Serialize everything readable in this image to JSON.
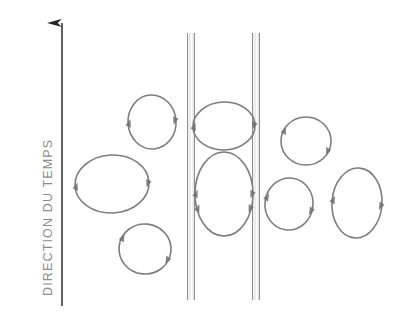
{
  "figure": {
    "width": 407,
    "height": 319,
    "background": "#ffffff",
    "kind": "schematic-diagram"
  },
  "axis": {
    "label": "DIRECTION DU TEMPS",
    "orientation": "vertical-upward",
    "color": "#8c8c8c",
    "line_color": "#2b2b2b",
    "x": 62,
    "y_top": 22,
    "y_bottom": 306,
    "arrowhead": "up"
  },
  "rails": {
    "color": "#8a8a8a",
    "y_top": 33,
    "y_bottom": 300,
    "items": [
      {
        "name": "rail-left",
        "x": 191,
        "band_width": 7
      },
      {
        "name": "rail-right",
        "x": 256,
        "band_width": 7
      }
    ]
  },
  "loops": {
    "stroke_color": "#7d7d7d",
    "node_color": "#6f6f6f",
    "items": [
      {
        "name": "loop-upper-left-small",
        "cx": 152,
        "cy": 122,
        "rx": 24,
        "ry": 27,
        "rotate": -4,
        "nodes": [
          180,
          0
        ]
      },
      {
        "name": "loop-mid-left-large",
        "cx": 112,
        "cy": 184,
        "rx": 37,
        "ry": 29,
        "rotate": -3,
        "nodes": [
          178,
          2
        ]
      },
      {
        "name": "loop-lower-left-small",
        "cx": 145,
        "cy": 249,
        "rx": 26,
        "ry": 25,
        "rotate": 6,
        "nodes": [
          200,
          20
        ]
      },
      {
        "name": "loop-center-upper",
        "cx": 224,
        "cy": 126,
        "rx": 31,
        "ry": 24,
        "rotate": -2,
        "nodes": [
          180,
          0
        ]
      },
      {
        "name": "loop-center-lower",
        "cx": 224,
        "cy": 194,
        "rx": 29,
        "ry": 42,
        "rotate": 0,
        "nodes": [
          180,
          0,
          160,
          20
        ]
      },
      {
        "name": "loop-upper-right",
        "cx": 306,
        "cy": 141,
        "rx": 25,
        "ry": 24,
        "rotate": 0,
        "nodes": [
          205,
          25
        ]
      },
      {
        "name": "loop-lower-right-small",
        "cx": 289,
        "cy": 204,
        "rx": 24,
        "ry": 26,
        "rotate": 8,
        "nodes": [
          188,
          8
        ]
      },
      {
        "name": "loop-far-right-tall",
        "cx": 357,
        "cy": 203,
        "rx": 25,
        "ry": 35,
        "rotate": 4,
        "nodes": [
          182,
          2
        ]
      }
    ]
  }
}
